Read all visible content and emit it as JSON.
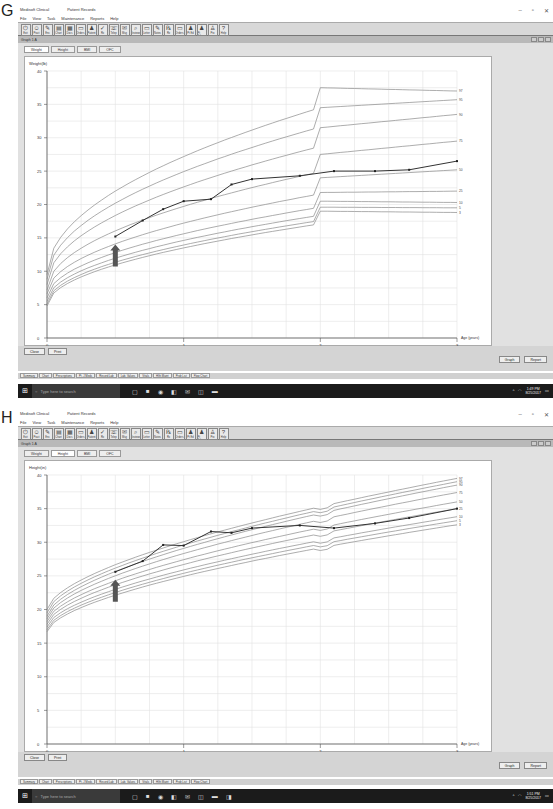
{
  "panels": [
    {
      "letter": "G",
      "window": {
        "title": "Medisoft Clinical",
        "subtitle_record": "Patient Records",
        "controls": [
          "–",
          "▫",
          "✕"
        ],
        "menu": [
          "File",
          "View",
          "Task",
          "Maintenance",
          "Reports",
          "Help"
        ],
        "toolbar": [
          "Exit",
          "Pract",
          "Enc",
          "Chart",
          "Docs",
          "Orders",
          "Patient",
          "Rx",
          "Telep",
          "Msg",
          "Reviews",
          "Letter",
          "Notes",
          "Rx",
          "Orders",
          "Pt Ed",
          "Pt Educ",
          "Pro",
          "Help"
        ],
        "child_title": "Graph 1 A",
        "tabs": [
          {
            "label": "Weight",
            "active": true
          },
          {
            "label": "Height",
            "active": false
          },
          {
            "label": "BMI",
            "active": false
          },
          {
            "label": "OFC",
            "active": false
          }
        ],
        "buttons": {
          "close": "Close",
          "print": "Print",
          "graph": "Graph",
          "report": "Report"
        },
        "status_tabs": [
          "Summary",
          "Chart",
          "Prescriptions",
          "Pt. J Meds",
          "Record Lab",
          "Lab. Values",
          "Vitals",
          "Hlth Maint",
          "Prob List",
          "Flow Chart"
        ],
        "taskbar": {
          "search_placeholder": "Type here to search",
          "time": "1:49 PM",
          "date": "8/25/2017"
        }
      }
    },
    {
      "letter": "H",
      "window": {
        "title": "Medisoft Clinical",
        "subtitle_record": "Patient Records",
        "controls": [
          "–",
          "▫",
          "✕"
        ],
        "menu": [
          "File",
          "View",
          "Task",
          "Maintenance",
          "Reports",
          "Help"
        ],
        "toolbar": [
          "Exit",
          "Pract",
          "Enc",
          "Chart",
          "Docs",
          "Orders",
          "Patient",
          "Rx",
          "Telep",
          "Msg",
          "Reviews",
          "Letter",
          "Notes",
          "Rx",
          "Orders",
          "Pt Ed",
          "Pt Educ",
          "Pro",
          "Help"
        ],
        "child_title": "Graph 1 A",
        "tabs": [
          {
            "label": "Weight",
            "active": false
          },
          {
            "label": "Height",
            "active": true
          },
          {
            "label": "BMI",
            "active": false
          },
          {
            "label": "OFC",
            "active": false
          }
        ],
        "buttons": {
          "close": "Close",
          "print": "Print",
          "graph": "Graph",
          "report": "Report"
        },
        "status_tabs": [
          "Summary",
          "Chart",
          "Prescriptions",
          "Pt. J Meds",
          "Record Lab",
          "Lab. Values",
          "Vitals",
          "Hlth Maint",
          "Prob List",
          "Flow Chart"
        ],
        "taskbar": {
          "search_placeholder": "Type here to search",
          "time": "1:51 PM",
          "date": "8/25/2017"
        }
      }
    }
  ],
  "chart_data": [
    {
      "type": "line",
      "title": "Weight (kg)",
      "ylabel": "Weight(lb)",
      "xlabel": "Age (years)",
      "xlim": [
        0,
        3
      ],
      "ylim": [
        0,
        40
      ],
      "xticks": [
        "0",
        "1",
        "2",
        "3"
      ],
      "yticks": [
        "0",
        "5",
        "10",
        "15",
        "20",
        "25",
        "30",
        "35",
        "40"
      ],
      "percentile_labels": [
        "97",
        "95",
        "90",
        "75",
        "50",
        "25",
        "10",
        "5",
        "3"
      ],
      "patient_series": {
        "name": "Patient weight",
        "x": [
          0.5,
          0.7,
          0.85,
          1.0,
          1.2,
          1.35,
          1.5,
          1.85,
          2.1,
          2.4,
          2.65,
          3.0
        ],
        "y": [
          15.2,
          17.6,
          19.3,
          20.5,
          20.8,
          23.0,
          23.8,
          24.3,
          25.0,
          25.0,
          25.2,
          26.5
        ]
      },
      "annotation": {
        "type": "arrow",
        "x": 0.5,
        "label": "arrow marks start of treatment"
      }
    },
    {
      "type": "line",
      "title": "Height",
      "ylabel": "Height(in)",
      "xlabel": "Age (years)",
      "xlim": [
        0,
        3
      ],
      "ylim": [
        0,
        40
      ],
      "xticks": [
        "0",
        "1",
        "2",
        "3"
      ],
      "yticks": [
        "0",
        "5",
        "10",
        "15",
        "20",
        "25",
        "30",
        "35",
        "40"
      ],
      "percentile_labels": [
        "97",
        "95",
        "90",
        "75",
        "50",
        "25",
        "10",
        "5",
        "3"
      ],
      "patient_series": {
        "name": "Patient height",
        "x": [
          0.5,
          0.7,
          0.85,
          1.0,
          1.2,
          1.35,
          1.5,
          1.85,
          2.1,
          2.4,
          2.65,
          3.0
        ],
        "y": [
          25.6,
          27.2,
          29.6,
          29.5,
          31.6,
          31.4,
          32.1,
          32.5,
          32.1,
          32.8,
          33.6,
          35.0
        ]
      },
      "annotation": {
        "type": "arrow",
        "x": 0.5,
        "label": "arrow marks start of treatment"
      }
    }
  ]
}
